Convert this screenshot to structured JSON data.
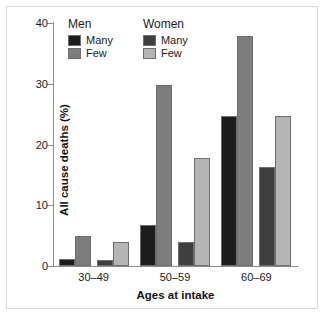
{
  "chart_data": {
    "type": "bar",
    "title": "",
    "xlabel": "Ages at intake",
    "ylabel": "All cause deaths (%)",
    "categories": [
      "30–49",
      "50–59",
      "60–69"
    ],
    "ylim": [
      0,
      40
    ],
    "yticks": [
      0,
      10,
      20,
      30,
      40
    ],
    "ytick_labels": [
      "0",
      "10",
      "20",
      "30",
      "40"
    ],
    "grid": false,
    "legend_position": "top-left-inside",
    "series": [
      {
        "name": "Men Many",
        "group": "Men",
        "level": "Many",
        "color": "#1c1c1c",
        "values": [
          1.2,
          6.8,
          24.7
        ]
      },
      {
        "name": "Men Few",
        "group": "Men",
        "level": "Few",
        "color": "#7d7d7d",
        "values": [
          4.9,
          29.8,
          37.8
        ]
      },
      {
        "name": "Women Many",
        "group": "Women",
        "level": "Many",
        "color": "#3f3f3f",
        "values": [
          1.0,
          4.0,
          16.3
        ]
      },
      {
        "name": "Women Few",
        "group": "Women",
        "level": "Few",
        "color": "#b5b5b5",
        "values": [
          3.9,
          17.8,
          24.7
        ]
      }
    ]
  },
  "legend": {
    "columns": [
      {
        "title": "Men",
        "entries": [
          {
            "label": "Many",
            "color": "#1c1c1c"
          },
          {
            "label": "Few",
            "color": "#7d7d7d"
          }
        ]
      },
      {
        "title": "Women",
        "entries": [
          {
            "label": "Many",
            "color": "#3f3f3f"
          },
          {
            "label": "Few",
            "color": "#b5b5b5"
          }
        ]
      }
    ]
  },
  "style": {
    "axis_color": "#8c8c8c",
    "bar_edge_color": "#6e6e6e",
    "frame_color": "#d9d9d9",
    "background": "#ffffff",
    "text_color": "#1a1a1a"
  }
}
